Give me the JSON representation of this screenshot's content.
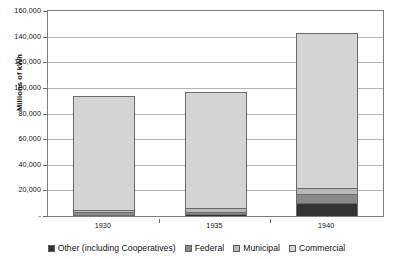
{
  "chart_data": {
    "type": "bar",
    "stacked": true,
    "title": "",
    "xlabel": "",
    "ylabel": "Millions of kWh",
    "categories": [
      "1930",
      "1935",
      "1940"
    ],
    "ylim": [
      0,
      160000
    ],
    "ytick_labels": [
      "160,000",
      "140,000",
      "120,000",
      "100,000",
      "80,000",
      "60,000",
      "40,000",
      "20,000",
      "-"
    ],
    "ytick_values": [
      160000,
      140000,
      120000,
      100000,
      80000,
      60000,
      40000,
      20000,
      0
    ],
    "grid": true,
    "legend_position": "bottom",
    "series": [
      {
        "name": "Other (including Cooperatives)",
        "color": "#333333",
        "values": [
          1000,
          1200,
          10500
        ]
      },
      {
        "name": "Federal",
        "color": "#8a8a8a",
        "values": [
          1800,
          2200,
          7000
        ]
      },
      {
        "name": "Municipal",
        "color": "#b9b9b9",
        "values": [
          2200,
          2600,
          4500
        ]
      },
      {
        "name": "Commercial",
        "color": "#d4d4d4",
        "values": [
          88000,
          90000,
          120000
        ]
      }
    ],
    "totals": [
      93000,
      96000,
      142000
    ],
    "units": "Millions of kWh"
  },
  "legend": {
    "items": [
      {
        "label": "Other (including Cooperatives)",
        "color": "#333333"
      },
      {
        "label": "Federal",
        "color": "#8a8a8a"
      },
      {
        "label": "Municipal",
        "color": "#b9b9b9"
      },
      {
        "label": "Commercial",
        "color": "#d4d4d4"
      }
    ]
  }
}
